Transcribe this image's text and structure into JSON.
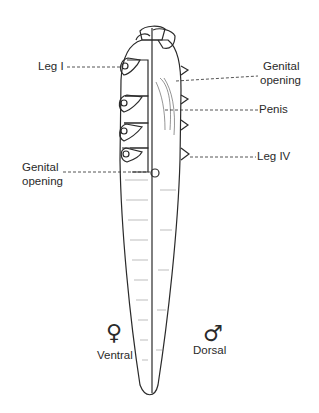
{
  "figure": {
    "labels": {
      "leg_1": "Leg I",
      "genital_opening_right": [
        "Genital",
        "opening"
      ],
      "penis": "Penis",
      "leg_4": "Leg IV",
      "genital_opening_left": [
        "Genital",
        "opening"
      ],
      "ventral": "Ventral",
      "dorsal": "Dorsal"
    },
    "symbols": {
      "female": "♀",
      "male": "♂"
    },
    "colors": {
      "line": "#2a2a2a",
      "background": "#ffffff"
    }
  }
}
